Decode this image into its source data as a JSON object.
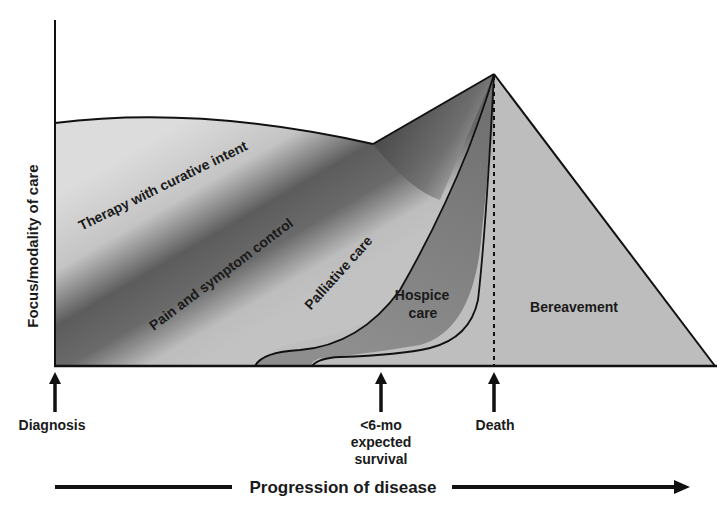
{
  "diagram": {
    "y_axis_label": "Focus/modality of care",
    "x_axis_label": "Progression of disease",
    "regions": {
      "therapy": "Therapy with curative intent",
      "pain": "Pain and symptom control",
      "palliative": "Palliative care",
      "hospice_line1": "Hospice",
      "hospice_line2": "care",
      "bereavement": "Bereavement"
    },
    "markers": {
      "diagnosis": "Diagnosis",
      "six_month_line1": "<6-mo",
      "six_month_line2": "expected",
      "six_month_line3": "survival",
      "death": "Death"
    },
    "colors": {
      "therapy_fill": "#d9d9d9",
      "pain_dark": "#5a5a5a",
      "palliative_fill": "#b8b8b8",
      "hospice_fill": "#8a8a8a",
      "bereavement_fill": "#bdbdbd",
      "line": "#111111"
    }
  }
}
